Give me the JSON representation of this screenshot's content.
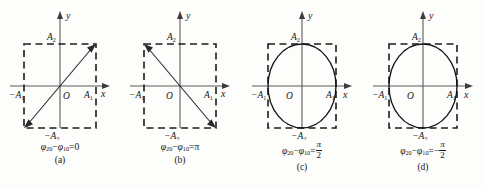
{
  "figure": {
    "panel_width": 120,
    "colors": {
      "background": "#fdfdfb",
      "axis": "#5a5a5a",
      "dashed_box": "#1c1c1c",
      "curve": "#151515",
      "text": "#161616"
    },
    "axis_labels": {
      "x": "x",
      "y": "y",
      "origin": "O",
      "x_pos": "A",
      "x_pos_sub": "1",
      "x_neg": "−A",
      "x_neg_sub": "1",
      "y_pos": "A",
      "y_pos_sub": "2",
      "y_neg": "−A",
      "y_neg_sub": "2"
    },
    "equation_common": {
      "phi2": "φ",
      "phi2_sub": "20",
      "minus": "−",
      "phi1": "φ",
      "phi1_sub": "10",
      "equals": "="
    },
    "panels": [
      {
        "id": "panel-a",
        "label": "(a)",
        "shape": "line-positive-slope",
        "phase_difference": "0",
        "phase_value_display": "0",
        "equation_text": "φ₂₀−φ₁₀=0",
        "has_fraction": false,
        "left": 0
      },
      {
        "id": "panel-b",
        "label": "(b)",
        "shape": "line-negative-slope",
        "phase_difference": "π",
        "phase_value_display": "π",
        "equation_text": "φ₂₀−φ₁₀=π",
        "has_fraction": false,
        "left": 120
      },
      {
        "id": "panel-c",
        "label": "(c)",
        "shape": "ellipse-upright",
        "phase_difference": "π/2",
        "phase_numerator": "π",
        "phase_denominator": "2",
        "phase_sign": "",
        "equation_text": "φ₂₀−φ₁₀=π/2",
        "has_fraction": true,
        "left": 242
      },
      {
        "id": "panel-d",
        "label": "(d)",
        "shape": "ellipse-upright",
        "phase_difference": "−π/2",
        "phase_numerator": "π",
        "phase_denominator": "2",
        "phase_sign": "−",
        "equation_text": "φ₂₀−φ₁₀=−π/2",
        "has_fraction": true,
        "left": 363
      }
    ]
  }
}
